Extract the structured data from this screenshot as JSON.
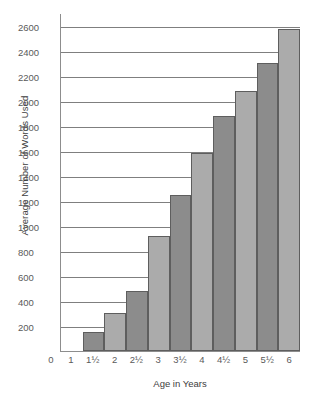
{
  "chart_data": {
    "type": "bar",
    "title": "",
    "xlabel": "Age in Years",
    "ylabel": "Average Number of Words Used",
    "categories": [
      "1",
      "1½",
      "2",
      "2½",
      "3",
      "3½",
      "4",
      "4½",
      "5",
      "5½",
      "6"
    ],
    "values": [
      null,
      150,
      300,
      480,
      920,
      1250,
      1580,
      1880,
      2080,
      2300,
      2570
    ],
    "ylim": [
      0,
      2700
    ],
    "yticks": [
      200,
      400,
      600,
      800,
      1000,
      1200,
      1400,
      1600,
      1800,
      2000,
      2200,
      2400,
      2600
    ],
    "ytick_labels": [
      "200",
      "400",
      "600",
      "800",
      "1000",
      "1200",
      "1400",
      "1600",
      "1800",
      "2000",
      "2200",
      "2400",
      "2600"
    ],
    "origin_label": "0",
    "grid": true,
    "legend": null,
    "bar_colors": [
      "#8c8c8c",
      "#ababab"
    ],
    "bar_border_color": "#5e5e5e",
    "axis_color": "#8d8d8d",
    "grid_color": "#7f7f7f",
    "background": "#ffffff"
  }
}
